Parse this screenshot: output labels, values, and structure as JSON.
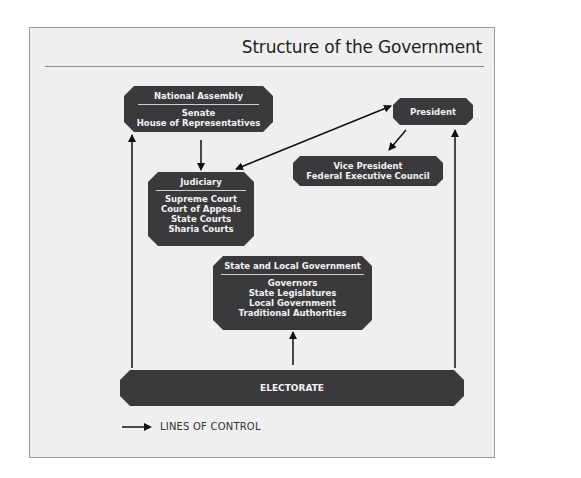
{
  "title": "Structure of the Government",
  "nodes": {
    "national_assembly": {
      "heading": "National Assembly",
      "lines": [
        "Senate",
        "House of Representatives"
      ]
    },
    "president": {
      "label": "President"
    },
    "vice_president": {
      "lines": [
        "Vice President",
        "Federal Executive Council"
      ]
    },
    "judiciary": {
      "heading": "Judiciary",
      "lines": [
        "Supreme Court",
        "Court of Appeals",
        "State Courts",
        "Sharia Courts"
      ]
    },
    "state_local": {
      "heading": "State and Local Government",
      "lines": [
        "Governors",
        "State Legislatures",
        "Local Government",
        "Traditional Authorities"
      ]
    },
    "electorate": {
      "label": "ELECTORATE"
    }
  },
  "edges": [
    {
      "from": "electorate",
      "to": "national_assembly",
      "type": "single"
    },
    {
      "from": "electorate",
      "to": "president",
      "type": "single"
    },
    {
      "from": "electorate",
      "to": "state_local",
      "type": "single"
    },
    {
      "from": "national_assembly",
      "to": "judiciary",
      "type": "single"
    },
    {
      "from": "president",
      "to": "vice_president",
      "type": "single"
    },
    {
      "from": "judiciary",
      "to": "president",
      "type": "double"
    }
  ],
  "legend": {
    "label": "LINES OF CONTROL",
    "icon": "arrow-right-icon"
  },
  "colors": {
    "node_fill": "#3a3a3c",
    "background": "#efefef",
    "text_light": "#f2f2f2",
    "arrow": "#111111"
  }
}
